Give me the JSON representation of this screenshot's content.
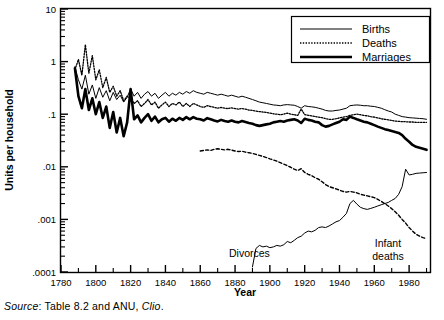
{
  "axes": {
    "ylabel": "Units per household",
    "xlabel": "Year",
    "ytick_labels": [
      "10",
      "1",
      ".1",
      ".01",
      ".001",
      ".0001"
    ],
    "xtick_labels": [
      "1780",
      "1800",
      "1820",
      "1840",
      "1860",
      "1880",
      "1900",
      "1920",
      "1940",
      "1960",
      "1980"
    ]
  },
  "legend": {
    "items": [
      {
        "label": "Births",
        "style": "thin-solid"
      },
      {
        "label": "Deaths",
        "style": "dotted"
      },
      {
        "label": "Marriages",
        "style": "thick-solid"
      }
    ]
  },
  "annotations": {
    "divorces": "Divorces",
    "infant_deaths_line1": "Infant",
    "infant_deaths_line2": "deaths"
  },
  "source": {
    "prefix": "Source",
    "middle": ": Table 8.2 and ANU, ",
    "italic_end": "Clio",
    "suffix": "."
  },
  "colors": {
    "ink": "#000000",
    "paper": "#ffffff"
  },
  "chart_data": {
    "type": "line",
    "title": "",
    "xlabel": "Year",
    "ylabel": "Units per household",
    "yscale": "log",
    "ylim": [
      0.0001,
      10
    ],
    "xlim": [
      1780,
      1992
    ],
    "grid": false,
    "legend_position": "top-right",
    "ytick_values": [
      10,
      1,
      0.1,
      0.01,
      0.001,
      0.0001
    ],
    "xtick_values": [
      1780,
      1800,
      1820,
      1840,
      1860,
      1880,
      1900,
      1920,
      1940,
      1960,
      1980
    ],
    "annotations": [
      {
        "text": "Divorces",
        "x": 1885,
        "y": 0.00035
      },
      {
        "text": "Infant deaths",
        "x": 1978,
        "y": 0.0004
      }
    ],
    "series": [
      {
        "name": "Births",
        "style": "thin-solid",
        "x": [
          1788,
          1790,
          1792,
          1794,
          1796,
          1798,
          1800,
          1802,
          1804,
          1806,
          1808,
          1810,
          1812,
          1814,
          1816,
          1818,
          1820,
          1822,
          1824,
          1826,
          1828,
          1830,
          1832,
          1834,
          1836,
          1838,
          1840,
          1842,
          1844,
          1846,
          1848,
          1850,
          1852,
          1854,
          1856,
          1858,
          1860,
          1862,
          1864,
          1866,
          1868,
          1870,
          1872,
          1874,
          1876,
          1878,
          1880,
          1882,
          1884,
          1886,
          1888,
          1890,
          1892,
          1894,
          1896,
          1898,
          1900,
          1902,
          1904,
          1906,
          1908,
          1910,
          1912,
          1914,
          1916,
          1918,
          1920,
          1922,
          1924,
          1926,
          1928,
          1930,
          1932,
          1934,
          1936,
          1938,
          1940,
          1942,
          1944,
          1946,
          1948,
          1950,
          1952,
          1954,
          1956,
          1958,
          1960,
          1962,
          1964,
          1966,
          1968,
          1970,
          1972,
          1974,
          1976,
          1978,
          1980,
          1982,
          1984,
          1986,
          1988,
          1990
        ],
        "y": [
          0.8,
          0.45,
          0.3,
          0.55,
          0.24,
          0.36,
          0.2,
          0.32,
          0.21,
          0.28,
          0.18,
          0.26,
          0.19,
          0.23,
          0.17,
          0.21,
          0.3,
          0.22,
          0.26,
          0.2,
          0.24,
          0.27,
          0.22,
          0.25,
          0.2,
          0.23,
          0.26,
          0.22,
          0.25,
          0.23,
          0.26,
          0.24,
          0.27,
          0.25,
          0.28,
          0.26,
          0.25,
          0.24,
          0.26,
          0.25,
          0.24,
          0.23,
          0.24,
          0.23,
          0.22,
          0.23,
          0.22,
          0.21,
          0.22,
          0.21,
          0.2,
          0.19,
          0.18,
          0.17,
          0.165,
          0.16,
          0.155,
          0.15,
          0.148,
          0.145,
          0.15,
          0.152,
          0.15,
          0.148,
          0.14,
          0.13,
          0.145,
          0.14,
          0.138,
          0.135,
          0.13,
          0.125,
          0.118,
          0.115,
          0.115,
          0.118,
          0.12,
          0.125,
          0.13,
          0.145,
          0.148,
          0.15,
          0.148,
          0.145,
          0.145,
          0.142,
          0.14,
          0.135,
          0.13,
          0.122,
          0.115,
          0.11,
          0.1,
          0.095,
          0.09,
          0.088,
          0.086,
          0.085,
          0.084,
          0.083,
          0.082,
          0.08
        ]
      },
      {
        "name": "Deaths",
        "style": "dotted",
        "x": [
          1788,
          1790,
          1792,
          1794,
          1796,
          1798,
          1800,
          1802,
          1804,
          1806,
          1808,
          1810,
          1812,
          1814,
          1816,
          1818,
          1820,
          1822,
          1824,
          1826,
          1828,
          1830,
          1832,
          1834,
          1836,
          1838,
          1840,
          1842,
          1844,
          1846,
          1848,
          1850,
          1852,
          1854,
          1856,
          1858,
          1860,
          1862,
          1864,
          1866,
          1868,
          1870,
          1872,
          1874,
          1876,
          1878,
          1880,
          1882,
          1884,
          1886,
          1888,
          1890,
          1892,
          1894,
          1896,
          1898,
          1900,
          1902,
          1904,
          1906,
          1908,
          1910,
          1912,
          1914,
          1916,
          1918,
          1920,
          1922,
          1924,
          1926,
          1928,
          1930,
          1932,
          1934,
          1936,
          1938,
          1940,
          1942,
          1944,
          1946,
          1948,
          1950,
          1952,
          1954,
          1956,
          1958,
          1960,
          1962,
          1964,
          1966,
          1968,
          1970,
          1972,
          1974,
          1976,
          1978,
          1980,
          1982,
          1984,
          1986,
          1988,
          1990
        ],
        "y": [
          0.7,
          1.1,
          0.55,
          2.1,
          0.6,
          1.3,
          0.45,
          0.7,
          0.32,
          0.5,
          0.26,
          0.34,
          0.22,
          0.28,
          0.18,
          0.22,
          0.2,
          0.16,
          0.18,
          0.14,
          0.16,
          0.19,
          0.15,
          0.17,
          0.13,
          0.15,
          0.17,
          0.14,
          0.16,
          0.15,
          0.17,
          0.14,
          0.16,
          0.14,
          0.16,
          0.15,
          0.14,
          0.135,
          0.145,
          0.14,
          0.135,
          0.13,
          0.135,
          0.13,
          0.128,
          0.132,
          0.128,
          0.125,
          0.128,
          0.125,
          0.12,
          0.118,
          0.115,
          0.112,
          0.11,
          0.108,
          0.105,
          0.102,
          0.1,
          0.098,
          0.1,
          0.105,
          0.1,
          0.098,
          0.095,
          0.125,
          0.098,
          0.095,
          0.093,
          0.09,
          0.088,
          0.086,
          0.082,
          0.08,
          0.08,
          0.082,
          0.085,
          0.088,
          0.09,
          0.095,
          0.098,
          0.1,
          0.098,
          0.095,
          0.093,
          0.09,
          0.088,
          0.085,
          0.082,
          0.08,
          0.078,
          0.076,
          0.074,
          0.073,
          0.072,
          0.072,
          0.071,
          0.071,
          0.07,
          0.07,
          0.07,
          0.07
        ]
      },
      {
        "name": "Marriages",
        "style": "thick-solid",
        "x": [
          1788,
          1790,
          1792,
          1794,
          1796,
          1798,
          1800,
          1802,
          1804,
          1806,
          1808,
          1810,
          1812,
          1814,
          1816,
          1818,
          1820,
          1822,
          1824,
          1826,
          1828,
          1830,
          1832,
          1834,
          1836,
          1838,
          1840,
          1842,
          1844,
          1846,
          1848,
          1850,
          1852,
          1854,
          1856,
          1858,
          1860,
          1862,
          1864,
          1866,
          1868,
          1870,
          1872,
          1874,
          1876,
          1878,
          1880,
          1882,
          1884,
          1886,
          1888,
          1890,
          1892,
          1894,
          1896,
          1898,
          1900,
          1902,
          1904,
          1906,
          1908,
          1910,
          1912,
          1914,
          1916,
          1918,
          1920,
          1922,
          1924,
          1926,
          1928,
          1930,
          1932,
          1934,
          1936,
          1938,
          1940,
          1942,
          1944,
          1946,
          1948,
          1950,
          1952,
          1954,
          1956,
          1958,
          1960,
          1962,
          1964,
          1966,
          1968,
          1970,
          1972,
          1974,
          1976,
          1978,
          1980,
          1982,
          1984,
          1986,
          1988,
          1990
        ],
        "y": [
          0.75,
          0.22,
          0.13,
          0.3,
          0.12,
          0.2,
          0.1,
          0.17,
          0.085,
          0.14,
          0.055,
          0.11,
          0.045,
          0.085,
          0.038,
          0.07,
          0.3,
          0.08,
          0.095,
          0.07,
          0.085,
          0.1,
          0.075,
          0.09,
          0.07,
          0.08,
          0.085,
          0.072,
          0.082,
          0.075,
          0.085,
          0.078,
          0.088,
          0.08,
          0.088,
          0.082,
          0.08,
          0.076,
          0.084,
          0.08,
          0.076,
          0.073,
          0.078,
          0.074,
          0.072,
          0.076,
          0.072,
          0.07,
          0.074,
          0.071,
          0.068,
          0.066,
          0.062,
          0.06,
          0.062,
          0.064,
          0.066,
          0.07,
          0.072,
          0.074,
          0.072,
          0.076,
          0.078,
          0.08,
          0.076,
          0.068,
          0.082,
          0.078,
          0.076,
          0.072,
          0.07,
          0.062,
          0.058,
          0.06,
          0.064,
          0.068,
          0.072,
          0.08,
          0.078,
          0.09,
          0.085,
          0.08,
          0.076,
          0.072,
          0.07,
          0.066,
          0.062,
          0.058,
          0.055,
          0.052,
          0.05,
          0.048,
          0.046,
          0.044,
          0.04,
          0.034,
          0.03,
          0.026,
          0.024,
          0.023,
          0.022,
          0.021
        ]
      },
      {
        "name": "Infant deaths",
        "style": "dashed",
        "x": [
          1860,
          1862,
          1864,
          1866,
          1868,
          1870,
          1872,
          1874,
          1876,
          1878,
          1880,
          1882,
          1884,
          1886,
          1888,
          1890,
          1892,
          1894,
          1896,
          1898,
          1900,
          1902,
          1904,
          1906,
          1908,
          1910,
          1912,
          1914,
          1916,
          1918,
          1920,
          1922,
          1924,
          1926,
          1928,
          1930,
          1932,
          1934,
          1936,
          1938,
          1940,
          1942,
          1944,
          1946,
          1948,
          1950,
          1952,
          1954,
          1956,
          1958,
          1960,
          1962,
          1964,
          1966,
          1968,
          1970,
          1972,
          1974,
          1976,
          1978,
          1980,
          1982,
          1984,
          1986,
          1988,
          1990
        ],
        "y": [
          0.02,
          0.0205,
          0.021,
          0.0205,
          0.0215,
          0.022,
          0.0215,
          0.021,
          0.0215,
          0.0208,
          0.02,
          0.0195,
          0.0198,
          0.019,
          0.0185,
          0.018,
          0.0172,
          0.0165,
          0.0158,
          0.015,
          0.0142,
          0.0135,
          0.0128,
          0.012,
          0.0112,
          0.0105,
          0.0098,
          0.009,
          0.0085,
          0.0092,
          0.0078,
          0.0072,
          0.0068,
          0.0062,
          0.0058,
          0.0052,
          0.0046,
          0.0042,
          0.004,
          0.0038,
          0.0036,
          0.0034,
          0.0033,
          0.0034,
          0.0033,
          0.0032,
          0.003,
          0.0029,
          0.0028,
          0.0027,
          0.0026,
          0.0024,
          0.0022,
          0.002,
          0.0018,
          0.0016,
          0.0014,
          0.0012,
          0.001,
          0.00085,
          0.0007,
          0.0006,
          0.00052,
          0.00048,
          0.00045,
          0.00043
        ]
      },
      {
        "name": "Divorces",
        "style": "thin-solid",
        "x": [
          1890,
          1892,
          1894,
          1896,
          1898,
          1900,
          1902,
          1904,
          1906,
          1908,
          1910,
          1912,
          1914,
          1916,
          1918,
          1920,
          1922,
          1924,
          1926,
          1928,
          1930,
          1932,
          1934,
          1936,
          1938,
          1940,
          1942,
          1944,
          1946,
          1948,
          1950,
          1952,
          1954,
          1956,
          1958,
          1960,
          1962,
          1964,
          1966,
          1968,
          1970,
          1972,
          1974,
          1976,
          1978,
          1980,
          1982,
          1984,
          1986,
          1988,
          1990
        ],
        "y": [
          0.000125,
          0.00028,
          0.00032,
          0.0003,
          0.00031,
          0.00029,
          0.0003,
          0.00032,
          0.00031,
          0.00033,
          0.00038,
          0.00036,
          0.0004,
          0.00045,
          0.00048,
          0.00055,
          0.0006,
          0.00058,
          0.00062,
          0.0007,
          0.00072,
          0.0007,
          0.00075,
          0.00082,
          0.0009,
          0.00095,
          0.0011,
          0.0013,
          0.002,
          0.0023,
          0.00195,
          0.0017,
          0.0016,
          0.00155,
          0.00162,
          0.0017,
          0.0018,
          0.0019,
          0.002,
          0.0021,
          0.0023,
          0.0025,
          0.003,
          0.0042,
          0.009,
          0.007,
          0.0072,
          0.0075,
          0.0076,
          0.0077,
          0.0078
        ]
      }
    ]
  }
}
